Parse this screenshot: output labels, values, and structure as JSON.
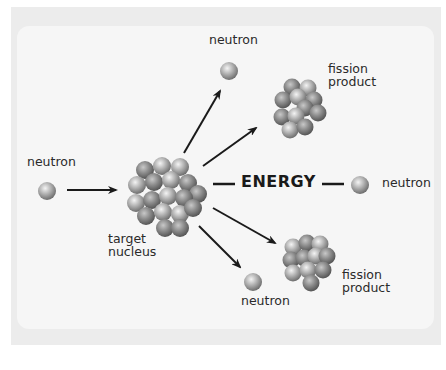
{
  "diagram": {
    "labels": {
      "incoming_neutron": "neutron",
      "target_nucleus_line1": "target",
      "target_nucleus_line2": "nucleus",
      "energy": "ENERGY",
      "neutron_top": "neutron",
      "neutron_right": "neutron",
      "neutron_bottom": "neutron",
      "fission_product_top_line1": "fission",
      "fission_product_top_line2": "product",
      "fission_product_bottom_line1": "fission",
      "fission_product_bottom_line2": "product"
    },
    "nodes": [
      {
        "id": "incoming-neutron",
        "type": "neutron"
      },
      {
        "id": "target-nucleus",
        "type": "nucleus"
      },
      {
        "id": "neutron-top",
        "type": "neutron"
      },
      {
        "id": "fission-product-top",
        "type": "nucleus"
      },
      {
        "id": "energy",
        "type": "text"
      },
      {
        "id": "neutron-right",
        "type": "neutron"
      },
      {
        "id": "fission-product-bottom",
        "type": "nucleus"
      },
      {
        "id": "neutron-bottom",
        "type": "neutron"
      }
    ],
    "edges": [
      {
        "from": "incoming-neutron",
        "to": "target-nucleus"
      },
      {
        "from": "target-nucleus",
        "to": "neutron-top"
      },
      {
        "from": "target-nucleus",
        "to": "fission-product-top"
      },
      {
        "from": "target-nucleus",
        "to": "energy"
      },
      {
        "from": "energy",
        "to": "neutron-right"
      },
      {
        "from": "target-nucleus",
        "to": "fission-product-bottom"
      },
      {
        "from": "target-nucleus",
        "to": "neutron-bottom"
      }
    ],
    "colors": {
      "frame": "#ececec",
      "panel": "#f6f6f6",
      "sphere_light": "#e8e8e8",
      "sphere_dark": "#7a7a7a",
      "arrow": "#1a1a1a"
    }
  }
}
